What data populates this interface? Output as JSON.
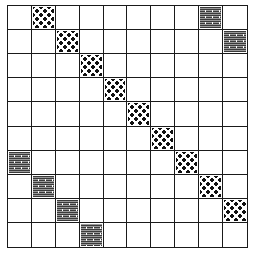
{
  "diagram": {
    "title": "",
    "rows": 10,
    "cols": 10,
    "patterns": {
      "dotted": {
        "label": "dotted",
        "color": "#111111"
      },
      "striped": {
        "label": "striped",
        "color": "#555555"
      }
    },
    "filled_cells": [
      {
        "row": 0,
        "col": 1,
        "pattern": "dotted"
      },
      {
        "row": 1,
        "col": 2,
        "pattern": "dotted"
      },
      {
        "row": 2,
        "col": 3,
        "pattern": "dotted"
      },
      {
        "row": 3,
        "col": 4,
        "pattern": "dotted"
      },
      {
        "row": 4,
        "col": 5,
        "pattern": "dotted"
      },
      {
        "row": 5,
        "col": 6,
        "pattern": "dotted"
      },
      {
        "row": 6,
        "col": 7,
        "pattern": "dotted"
      },
      {
        "row": 7,
        "col": 8,
        "pattern": "dotted"
      },
      {
        "row": 8,
        "col": 9,
        "pattern": "dotted"
      },
      {
        "row": 0,
        "col": 8,
        "pattern": "striped"
      },
      {
        "row": 1,
        "col": 9,
        "pattern": "striped"
      },
      {
        "row": 6,
        "col": 0,
        "pattern": "striped"
      },
      {
        "row": 7,
        "col": 1,
        "pattern": "striped"
      },
      {
        "row": 8,
        "col": 2,
        "pattern": "striped"
      },
      {
        "row": 9,
        "col": 3,
        "pattern": "striped"
      }
    ]
  }
}
